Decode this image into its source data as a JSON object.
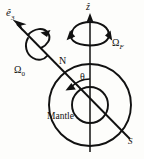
{
  "figure": {
    "background_color": "#fdfdfb",
    "stroke_color": "#111111"
  },
  "labels": {
    "spin_axis_vector": "ê",
    "spin_axis_vector_sub": "3",
    "precession_axis_vector": "ẑ",
    "precession_rate": "Ω",
    "precession_rate_sub": "F",
    "spin_rate": "Ω",
    "spin_rate_sub": "0",
    "north_pole": "N",
    "south_pole": "S",
    "tilt_angle": "θ",
    "mantle": "Mantle"
  },
  "geometry": {
    "mantle_circle": {
      "cx": 90,
      "cy": 105,
      "r": 41
    },
    "core_circle": {
      "cx": 90,
      "cy": 105,
      "r": 18
    },
    "z_axis": {
      "x": 90,
      "y_top": 18,
      "y_bottom": 152
    },
    "spin_axis": {
      "x1": 15,
      "y1": 22,
      "x2": 130,
      "y2": 139
    },
    "theta_arc_radius": 26
  },
  "icons": {
    "z_arrowhead": "arrow-up-icon",
    "e3_arrowhead": "arrow-upleft-icon",
    "precession_curl": "circular-arrow-icon",
    "spin_curl": "circular-arrow-icon",
    "theta_arc": "arc-arrow-icon"
  }
}
